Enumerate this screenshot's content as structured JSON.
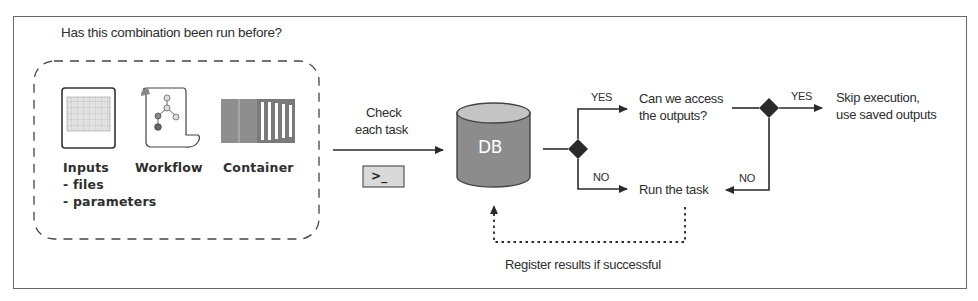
{
  "diagram": {
    "question_title": "Has this combination been run before?",
    "inputs_group": {
      "items": [
        {
          "icon": "spreadsheet-icon",
          "label": "Inputs",
          "sublines": [
            "- files",
            "- parameters"
          ]
        },
        {
          "icon": "workflow-scroll-icon",
          "label": "Workflow",
          "sublines": []
        },
        {
          "icon": "container-icon",
          "label": "Container",
          "sublines": []
        }
      ]
    },
    "check_step": {
      "label_line1": "Check",
      "label_line2": "each task",
      "terminal_icon": "terminal-icon",
      "terminal_glyph": ">_"
    },
    "database": {
      "label": "DB",
      "icon": "database-cylinder-icon"
    },
    "decision1": {
      "yes_label": "YES",
      "no_label": "NO"
    },
    "access_question": {
      "line1": "Can we access",
      "line2": "the outputs?"
    },
    "run_task": {
      "label": "Run the task"
    },
    "decision2": {
      "yes_label": "YES",
      "no_label": "NO"
    },
    "skip_result": {
      "line1": "Skip execution,",
      "line2": "use saved outputs"
    },
    "register_note": "Register results if successful",
    "colors": {
      "line": "#2a2a2a",
      "db_body": "#8c8c8c",
      "db_top": "#c4c4c4",
      "terminal_bg": "#dcdcdc",
      "frame": "#6a6a6a"
    }
  }
}
